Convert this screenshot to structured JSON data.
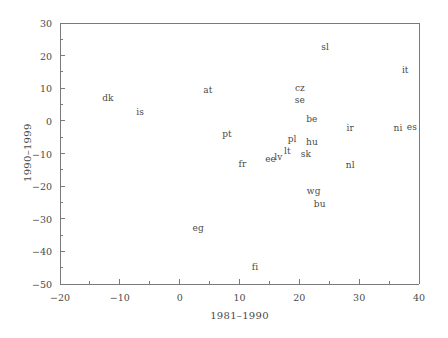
{
  "chart_data": {
    "type": "scatter",
    "title": "",
    "subtitle": "",
    "xlabel": "1981–1990",
    "ylabel": "1990–1999",
    "xlim": [
      -20,
      40
    ],
    "ylim": [
      -50,
      30
    ],
    "xticks": [
      -20,
      -10,
      0,
      10,
      20,
      30,
      40
    ],
    "xticklabels": [
      "−20",
      "−10",
      "0",
      "10",
      "20",
      "30",
      "40"
    ],
    "xminorticks": [
      -15,
      -5,
      5,
      15,
      25,
      35
    ],
    "yticks": [
      -50,
      -40,
      -30,
      -20,
      -10,
      0,
      10,
      20,
      30
    ],
    "yticklabels": [
      "−50",
      "−40",
      "−30",
      "−20",
      "−10",
      "0",
      "10",
      "20",
      "30"
    ],
    "yminorticks": [
      -45,
      -35,
      -25,
      -15,
      -5,
      5,
      15,
      25
    ],
    "grid": false,
    "legend": null,
    "marker_style": "text-label",
    "axis_color": "#7a7a7a",
    "label_color": "#4a4a4a",
    "background": "#ffffff",
    "points": [
      {
        "label": "dk",
        "x": -12.0,
        "y": 7.0
      },
      {
        "label": "is",
        "x": -6.6,
        "y": 2.7
      },
      {
        "label": "at",
        "x": 4.7,
        "y": 9.5
      },
      {
        "label": "sl",
        "x": 24.3,
        "y": 22.6
      },
      {
        "label": "it",
        "x": 37.7,
        "y": 15.6
      },
      {
        "label": "cz",
        "x": 20.1,
        "y": 10.1
      },
      {
        "label": "se",
        "x": 20.1,
        "y": 6.4
      },
      {
        "label": "pt",
        "x": 7.9,
        "y": -4.0
      },
      {
        "label": "be",
        "x": 22.1,
        "y": 0.6
      },
      {
        "label": "ir",
        "x": 28.5,
        "y": -2.2
      },
      {
        "label": "ni",
        "x": 36.5,
        "y": -2.2
      },
      {
        "label": "es",
        "x": 38.8,
        "y": -1.9
      },
      {
        "label": "pl",
        "x": 18.8,
        "y": -5.5
      },
      {
        "label": "hu",
        "x": 22.1,
        "y": -6.4
      },
      {
        "label": "sk",
        "x": 21.1,
        "y": -10.1
      },
      {
        "label": "lt",
        "x": 18.0,
        "y": -9.2
      },
      {
        "label": "lv",
        "x": 16.5,
        "y": -11.0
      },
      {
        "label": "ee",
        "x": 15.2,
        "y": -11.7
      },
      {
        "label": "fr",
        "x": 10.5,
        "y": -13.2
      },
      {
        "label": "nl",
        "x": 28.5,
        "y": -13.5
      },
      {
        "label": "wg",
        "x": 22.4,
        "y": -21.5
      },
      {
        "label": "bu",
        "x": 23.4,
        "y": -25.5
      },
      {
        "label": "eg",
        "x": 3.1,
        "y": -32.9
      },
      {
        "label": "fi",
        "x": 12.6,
        "y": -44.8
      }
    ]
  }
}
